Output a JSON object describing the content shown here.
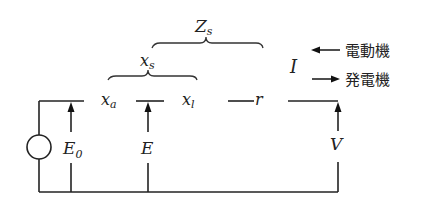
{
  "diagram": {
    "title": "",
    "brace_labels": {
      "Zs": {
        "main": "Z",
        "sub": "s"
      },
      "xs": {
        "main": "x",
        "sub": "s"
      }
    },
    "elements": {
      "xa": {
        "main": "x",
        "sub": "a"
      },
      "xl": {
        "main": "x",
        "sub": "l"
      },
      "r": "r"
    },
    "voltages": {
      "E0": {
        "main": "E",
        "sub": "0"
      },
      "E": "E",
      "V": "V"
    },
    "current": {
      "label": "I",
      "motor_label": "電動機",
      "generator_label": "発電機"
    },
    "source": "ac-voltage-source"
  }
}
